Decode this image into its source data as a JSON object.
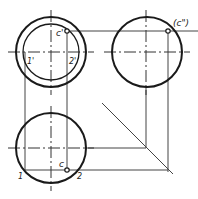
{
  "diagram": {
    "views": [
      {
        "name": "front-view",
        "cx": 51,
        "cy": 52,
        "r_outer": 35,
        "r_inner": 28
      },
      {
        "name": "side-view",
        "cx": 147,
        "cy": 52,
        "r": 35
      },
      {
        "name": "top-view",
        "cx": 51,
        "cy": 148,
        "r": 35
      }
    ],
    "labels": {
      "c_front": "c'",
      "c_side": "(c\")",
      "c_top": "c",
      "p1_front": "1'",
      "p2_front": "2'",
      "p1_top": "1",
      "p2_top": "2"
    },
    "points": {
      "c_front": {
        "x": 67,
        "y": 31
      },
      "c_side": {
        "x": 168,
        "y": 31
      },
      "c_top": {
        "x": 67,
        "y": 170
      }
    },
    "colors": {
      "stroke": "#1a1a1a",
      "thin": "#444444",
      "background": "#ffffff"
    }
  }
}
